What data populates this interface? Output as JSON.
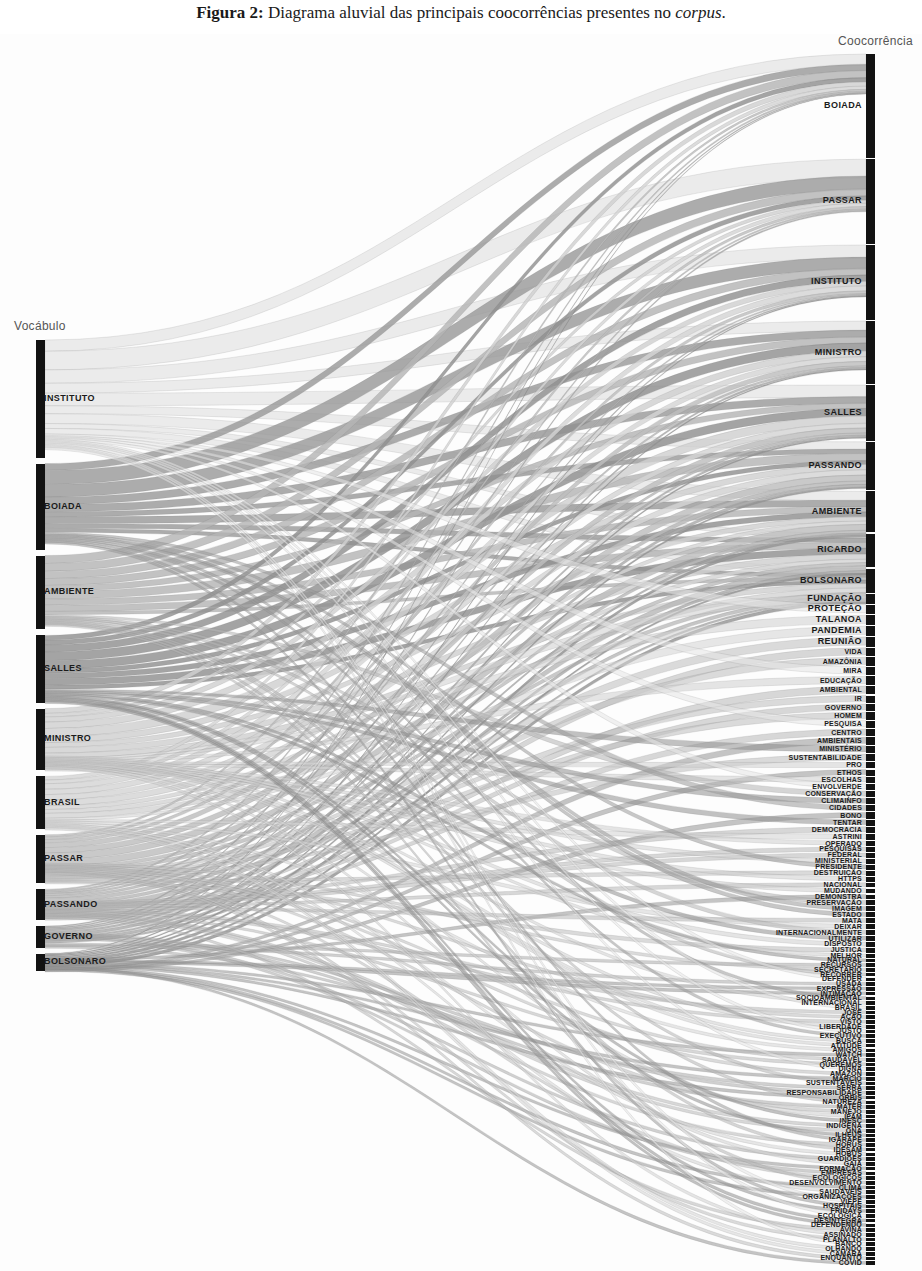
{
  "caption": {
    "prefix": "Figura 2:",
    "text": " Diagrama aluvial das principais coocorrências presentes no ",
    "italic": "corpus",
    "suffix": "."
  },
  "axes": {
    "left_title": "Vocábulo",
    "right_title": "Coocorrência"
  },
  "chart_data": {
    "type": "sankey",
    "title": "Diagrama aluvial das principais coocorrências presentes no corpus",
    "xlabel": "",
    "ylabel": "",
    "legend": "none",
    "grid": false,
    "left_axis_label": "Vocábulo",
    "right_axis_label": "Coocorrência",
    "left_nodes": [
      {
        "label": "INSTITUTO",
        "value": 175,
        "shade": "#e2e2e2"
      },
      {
        "label": "BOIADA",
        "value": 128,
        "shade": "#8f8f8f"
      },
      {
        "label": "AMBIENTE",
        "value": 110,
        "shade": "#a9a9a9"
      },
      {
        "label": "SALLES",
        "value": 100,
        "shade": "#8a8a8a"
      },
      {
        "label": "MINISTRO",
        "value": 92,
        "shade": "#c4c4c4"
      },
      {
        "label": "BRASIL",
        "value": 78,
        "shade": "#c9c9c9"
      },
      {
        "label": "PASSAR",
        "value": 72,
        "shade": "#b6b6b6"
      },
      {
        "label": "PASSANDO",
        "value": 46,
        "shade": "#b0b0b0"
      },
      {
        "label": "GOVERNO",
        "value": 32,
        "shade": "#a5a5a5"
      },
      {
        "label": "BOLSONARO",
        "value": 26,
        "shade": "#8c8c8c"
      }
    ],
    "right_nodes": [
      {
        "label": "BOIADA",
        "value": 86
      },
      {
        "label": "PASSAR",
        "value": 70
      },
      {
        "label": "INSTITUTO",
        "value": 62
      },
      {
        "label": "MINISTRO",
        "value": 52
      },
      {
        "label": "SALLES",
        "value": 46
      },
      {
        "label": "PASSANDO",
        "value": 40
      },
      {
        "label": "AMBIENTE",
        "value": 34
      },
      {
        "label": "RICARDO",
        "value": 28
      },
      {
        "label": "BOLSONARO",
        "value": 20
      },
      {
        "label": "FUNDAÇÃO",
        "value": 8
      },
      {
        "label": "PROTEÇÃO",
        "value": 8
      },
      {
        "label": "TALANOA",
        "value": 8
      },
      {
        "label": "PANDEMIA",
        "value": 8
      },
      {
        "label": "REUNIÃO",
        "value": 8
      },
      {
        "label": "VIDA",
        "value": 7
      },
      {
        "label": "AMAZÔNIA",
        "value": 7
      },
      {
        "label": "MIRA",
        "value": 7
      },
      {
        "label": "EDUCAÇÃO",
        "value": 7
      },
      {
        "label": "AMBIENTAL",
        "value": 7
      },
      {
        "label": "IR",
        "value": 6
      },
      {
        "label": "GOVERNO",
        "value": 6
      },
      {
        "label": "HOMEM",
        "value": 6
      },
      {
        "label": "PESQUISA",
        "value": 6
      },
      {
        "label": "CENTRO",
        "value": 6
      },
      {
        "label": "AMBIENTAIS",
        "value": 6
      },
      {
        "label": "MINISTÉRIO",
        "value": 6
      },
      {
        "label": "SUSTENTABILIDADE",
        "value": 6
      },
      {
        "label": "PRO",
        "value": 5
      },
      {
        "label": "ETHOS",
        "value": 5
      },
      {
        "label": "ESCOLHAS",
        "value": 5
      },
      {
        "label": "ENVOLVERDE",
        "value": 5
      },
      {
        "label": "CONSERVAÇÃO",
        "value": 5
      },
      {
        "label": "CLIMAINFO",
        "value": 5
      },
      {
        "label": "CIDADES",
        "value": 5
      },
      {
        "label": "BONO",
        "value": 5
      },
      {
        "label": "TENTAR",
        "value": 5
      },
      {
        "label": "DEMOCRACIA",
        "value": 5
      },
      {
        "label": "ASTRINI",
        "value": 5
      },
      {
        "label": "OPERADO",
        "value": 4
      },
      {
        "label": "PESQUISAS",
        "value": 4
      },
      {
        "label": "FEDERAL",
        "value": 4
      },
      {
        "label": "MINISTERIAL",
        "value": 4
      },
      {
        "label": "PRESIDENTE",
        "value": 4
      },
      {
        "label": "DESTRUIÇÃO",
        "value": 4
      },
      {
        "label": "HTTPS",
        "value": 4
      },
      {
        "label": "NACIONAL",
        "value": 4
      },
      {
        "label": "MUDANDO",
        "value": 4
      },
      {
        "label": "DEMONSTRA",
        "value": 4
      },
      {
        "label": "PRESERVAÇÃO",
        "value": 4
      },
      {
        "label": "IMAGEM",
        "value": 4
      },
      {
        "label": "ESTADO",
        "value": 4
      },
      {
        "label": "MATA",
        "value": 4
      },
      {
        "label": "DEIXAR",
        "value": 4
      },
      {
        "label": "INTERNACIONALMENTE",
        "value": 4
      },
      {
        "label": "UTILIZAR",
        "value": 4
      },
      {
        "label": "DISPOSTO",
        "value": 4
      },
      {
        "label": "JUSTIÇA",
        "value": 4
      },
      {
        "label": "MELHOR",
        "value": 3
      },
      {
        "label": "NATURAL",
        "value": 3
      },
      {
        "label": "RECURSOS",
        "value": 3
      },
      {
        "label": "SECRETÁRIO",
        "value": 3
      },
      {
        "label": "RECORRER",
        "value": 3
      },
      {
        "label": "DEFENDER",
        "value": 3
      },
      {
        "label": "USADA",
        "value": 3
      },
      {
        "label": "EXPRESSÃO",
        "value": 3
      },
      {
        "label": "INTIMAÇÃO",
        "value": 3
      },
      {
        "label": "SOCIOAMBIENTAL",
        "value": 3
      },
      {
        "label": "INTERNACIONAL",
        "value": 3
      },
      {
        "label": "BRASIL",
        "value": 3
      },
      {
        "label": "JOSÉ",
        "value": 3
      },
      {
        "label": "AÇÃO",
        "value": 3
      },
      {
        "label": "VISTO",
        "value": 3
      },
      {
        "label": "LIBERDADE",
        "value": 3
      },
      {
        "label": "JUSTO",
        "value": 3
      },
      {
        "label": "EXECUTIVO",
        "value": 3
      },
      {
        "label": "BUSCA",
        "value": 3
      },
      {
        "label": "ATITUDE",
        "value": 3
      },
      {
        "label": "AMIGOS",
        "value": 3
      },
      {
        "label": "WATCH",
        "value": 3
      },
      {
        "label": "SAUDÁVEL",
        "value": 3
      },
      {
        "label": "QUEREMOS",
        "value": 3
      },
      {
        "label": "DIGNA",
        "value": 3
      },
      {
        "label": "AMAZON",
        "value": 3
      },
      {
        "label": "MÁRCIO",
        "value": 3
      },
      {
        "label": "SUSTENTÁVEIS",
        "value": 3
      },
      {
        "label": "SERRA",
        "value": 3
      },
      {
        "label": "RESPONSABILIDADE",
        "value": 3
      },
      {
        "label": "ORBIS",
        "value": 3
      },
      {
        "label": "NATUREZA",
        "value": 3
      },
      {
        "label": "MATER",
        "value": 3
      },
      {
        "label": "MANEJO",
        "value": 3
      },
      {
        "label": "IPAM",
        "value": 3
      },
      {
        "label": "INESC",
        "value": 3
      },
      {
        "label": "INDÍGENA",
        "value": 3
      },
      {
        "label": "ONA",
        "value": 3
      },
      {
        "label": "ILHÉUS",
        "value": 3
      },
      {
        "label": "IGARAPÉ",
        "value": 3
      },
      {
        "label": "HORUS",
        "value": 3
      },
      {
        "label": "IDESAM",
        "value": 3
      },
      {
        "label": "HOBUS",
        "value": 3
      },
      {
        "label": "GUARDIÕES",
        "value": 3
      },
      {
        "label": "GAIA",
        "value": 3
      },
      {
        "label": "FORMAÇÃO",
        "value": 3
      },
      {
        "label": "EMPRESAS",
        "value": 3
      },
      {
        "label": "ECOLÓGICOS",
        "value": 3
      },
      {
        "label": "DESENVOLVIMENTO",
        "value": 3
      },
      {
        "label": "CLIMA",
        "value": 3
      },
      {
        "label": "SAUDÁVEIS",
        "value": 3
      },
      {
        "label": "ORGANIZAÇÕES",
        "value": 3
      },
      {
        "label": "VIEPE",
        "value": 3
      },
      {
        "label": "HOSPITAIS",
        "value": 3
      },
      {
        "label": "FRIDAYS",
        "value": 3
      },
      {
        "label": "ECOLÓGICA",
        "value": 3
      },
      {
        "label": "DESINTEGRA",
        "value": 3
      },
      {
        "label": "DEFENDENDO",
        "value": 3
      },
      {
        "label": "AVINA",
        "value": 3
      },
      {
        "label": "ASSINADO",
        "value": 3
      },
      {
        "label": "PLANALTO",
        "value": 3
      },
      {
        "label": "BANCO",
        "value": 3
      },
      {
        "label": "OLHANDO",
        "value": 3
      },
      {
        "label": "CÂMARA",
        "value": 3
      },
      {
        "label": "ENQUANTO",
        "value": 3
      },
      {
        "label": "COVID",
        "value": 3
      }
    ],
    "links_summary": "Wide ribbons flow from the ten Vocábulo nodes on the left to 123 Coocorrência nodes on the right; thickest ribbons connect INSTITUTO, BOIADA, AMBIENTE, SALLES and MINISTRO to BOIADA, PASSAR, INSTITUTO, MINISTRO and SALLES."
  },
  "colors": {
    "node": "#121212",
    "label": "#1b1b1b",
    "axis_title": "#555555",
    "background": "#ffffff"
  }
}
